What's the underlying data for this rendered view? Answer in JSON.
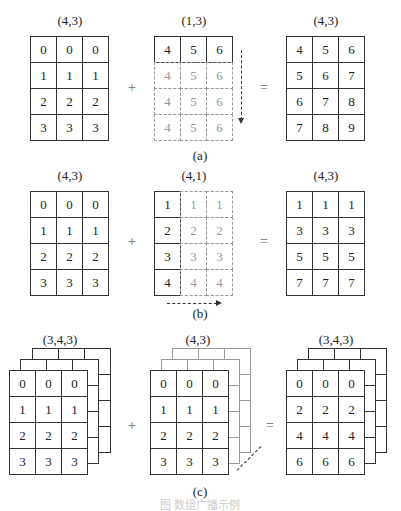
{
  "panels": [
    {
      "label": "(a)",
      "left": {
        "shape": "(4,3)",
        "rows": [
          [
            "0",
            "0",
            "0"
          ],
          [
            "1",
            "1",
            "1"
          ],
          [
            "2",
            "2",
            "2"
          ],
          [
            "3",
            "3",
            "3"
          ]
        ]
      },
      "right": {
        "shape": "(1,3)",
        "rows": [
          [
            "4",
            "5",
            "6"
          ]
        ],
        "ghost_rows": [
          [
            "4",
            "5",
            "6"
          ],
          [
            "4",
            "5",
            "6"
          ],
          [
            "4",
            "5",
            "6"
          ]
        ]
      },
      "result": {
        "shape": "(4,3)",
        "rows": [
          [
            "4",
            "5",
            "6"
          ],
          [
            "5",
            "6",
            "7"
          ],
          [
            "6",
            "7",
            "8"
          ],
          [
            "7",
            "8",
            "9"
          ]
        ]
      }
    },
    {
      "label": "(b)",
      "left": {
        "shape": "(4,3)",
        "rows": [
          [
            "0",
            "0",
            "0"
          ],
          [
            "1",
            "1",
            "1"
          ],
          [
            "2",
            "2",
            "2"
          ],
          [
            "3",
            "3",
            "3"
          ]
        ]
      },
      "right": {
        "shape": "(4,1)",
        "col": [
          "1",
          "2",
          "3",
          "4"
        ],
        "ghost_cols": [
          [
            "1",
            "2",
            "3",
            "4"
          ],
          [
            "1",
            "2",
            "3",
            "4"
          ]
        ]
      },
      "result": {
        "shape": "(4,3)",
        "rows": [
          [
            "1",
            "1",
            "1"
          ],
          [
            "3",
            "3",
            "3"
          ],
          [
            "5",
            "5",
            "5"
          ],
          [
            "7",
            "7",
            "7"
          ]
        ]
      }
    },
    {
      "label": "(c)",
      "left": {
        "shape": "(3,4,3)",
        "rows": [
          [
            "0",
            "0",
            "0"
          ],
          [
            "1",
            "1",
            "1"
          ],
          [
            "2",
            "2",
            "2"
          ],
          [
            "3",
            "3",
            "3"
          ]
        ]
      },
      "right": {
        "shape": "(4,3)",
        "rows": [
          [
            "0",
            "0",
            "0"
          ],
          [
            "1",
            "1",
            "1"
          ],
          [
            "2",
            "2",
            "2"
          ],
          [
            "3",
            "3",
            "3"
          ]
        ]
      },
      "result": {
        "shape": "(3,4,3)",
        "rows": [
          [
            "0",
            "0",
            "0"
          ],
          [
            "2",
            "2",
            "2"
          ],
          [
            "4",
            "4",
            "4"
          ],
          [
            "6",
            "6",
            "6"
          ]
        ]
      }
    }
  ],
  "operators": {
    "plus": "+",
    "equals": "="
  },
  "caption": "图  数组广播示例"
}
